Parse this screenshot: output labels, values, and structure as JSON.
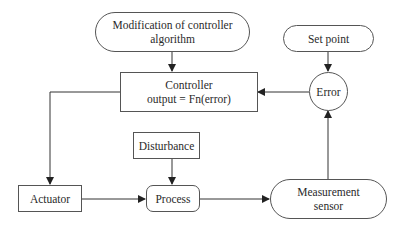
{
  "diagram": {
    "type": "flowchart",
    "title": "",
    "nodes": [
      {
        "id": "modification",
        "shape": "pill",
        "label_lines": [
          "Modification of controller",
          "algorithm"
        ]
      },
      {
        "id": "controller",
        "shape": "rectangle",
        "label_lines": [
          "Controller",
          "output = Fn(error)"
        ]
      },
      {
        "id": "set_point",
        "shape": "pill",
        "label_lines": [
          "Set point"
        ]
      },
      {
        "id": "error",
        "shape": "circle",
        "label_lines": [
          "Error"
        ]
      },
      {
        "id": "disturbance",
        "shape": "rectangle",
        "label_lines": [
          "Disturbance"
        ]
      },
      {
        "id": "actuator",
        "shape": "rectangle",
        "label_lines": [
          "Actuator"
        ]
      },
      {
        "id": "process",
        "shape": "rounded-rectangle",
        "label_lines": [
          "Process"
        ]
      },
      {
        "id": "measurement",
        "shape": "pill",
        "label_lines": [
          "Measurement",
          "sensor"
        ]
      }
    ],
    "edges": [
      {
        "from": "modification",
        "to": "controller"
      },
      {
        "from": "set_point",
        "to": "error"
      },
      {
        "from": "error",
        "to": "controller"
      },
      {
        "from": "controller",
        "to": "actuator"
      },
      {
        "from": "actuator",
        "to": "process"
      },
      {
        "from": "disturbance",
        "to": "process"
      },
      {
        "from": "process",
        "to": "measurement"
      },
      {
        "from": "measurement",
        "to": "error"
      }
    ],
    "colors": {
      "line": "#333333",
      "border": "#555555",
      "background": "#ffffff",
      "text": "#2a2a2a"
    }
  }
}
